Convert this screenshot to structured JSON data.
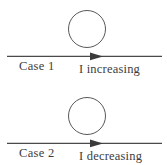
{
  "figure": {
    "background_color": "#ffffff",
    "ink_color": "#3c3c3c",
    "line_color": "#4a4a4a"
  },
  "cases": [
    {
      "case_label": "Case 1",
      "current_label": "I increasing",
      "loop_icon": "circle-loop-icon",
      "arrow_icon": "right-arrow-icon"
    },
    {
      "case_label": "Case 2",
      "current_label": "I decreasing",
      "loop_icon": "circle-loop-icon",
      "arrow_icon": "right-arrow-icon"
    }
  ]
}
